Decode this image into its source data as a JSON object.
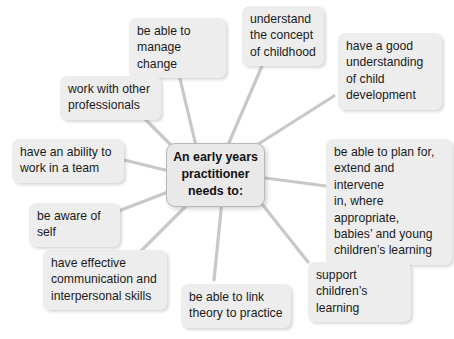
{
  "diagram": {
    "type": "mind-map",
    "title": "An early years practitioner needs to:",
    "background_color": "#ffffff",
    "node_fill_color": "#ededed",
    "connector_color": "#c8c8c8",
    "text_color": "#1b1b1b",
    "center": {
      "label": "An early years practitioner needs to:",
      "lines": [
        "An early years",
        "practitioner",
        "needs to:"
      ]
    },
    "branches": [
      {
        "id": "manage-change",
        "label": "be able to manage change",
        "lines": [
          "be able to",
          "manage change"
        ]
      },
      {
        "id": "concept-of-childhood",
        "label": "understand the concept of childhood",
        "lines": [
          "understand",
          "the concept",
          "of childhood"
        ]
      },
      {
        "id": "child-development",
        "label": "have a good understanding of child development",
        "lines": [
          "have a good",
          "understanding",
          "of child",
          "development"
        ]
      },
      {
        "id": "plan-extend-intervene",
        "label": "be able to plan for, extend and intervene in, where appropriate, babies' and young children's learning",
        "lines": [
          "be able to plan for,",
          "extend and intervene",
          "in, where appropriate,",
          "babies’ and young",
          "children’s learning"
        ]
      },
      {
        "id": "support-learning",
        "label": "support children's learning",
        "lines": [
          "support children’s",
          "learning"
        ]
      },
      {
        "id": "theory-to-practice",
        "label": "be able to link theory to practice",
        "lines": [
          "be able to link",
          "theory to practice"
        ]
      },
      {
        "id": "communication-skills",
        "label": "have effective communication and interpersonal skills",
        "lines": [
          "have effective",
          "communication and",
          "interpersonal skills"
        ]
      },
      {
        "id": "aware-of-self",
        "label": "be aware of self",
        "lines": [
          "be aware of self"
        ]
      },
      {
        "id": "work-in-a-team",
        "label": "have an ability to work in a team",
        "lines": [
          "have an ability to",
          "work in a team"
        ]
      },
      {
        "id": "other-professionals",
        "label": "work with other professionals",
        "lines": [
          "work with other",
          "professionals"
        ]
      }
    ]
  }
}
